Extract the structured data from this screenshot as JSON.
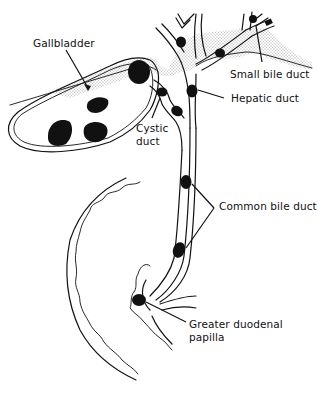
{
  "figure": {
    "type": "anatomical line drawing",
    "colors": {
      "ink": "#111111",
      "background": "#ffffff"
    }
  },
  "labels": {
    "gallbladder": "Gallbladder",
    "small_bile_duct": "Small bile duct",
    "hepatic_duct": "Hepatic duct",
    "cystic_duct_line1": "Cystic",
    "cystic_duct_line2": "duct",
    "common_bile_duct": "Common bile duct",
    "papilla_line1": "Greater duodenal",
    "papilla_line2": "papilla"
  },
  "structures": [
    {
      "name": "gallbladder",
      "stones": 4
    },
    {
      "name": "cystic duct",
      "stones": 2
    },
    {
      "name": "hepatic duct",
      "stones": 1
    },
    {
      "name": "small bile ducts",
      "stones": 3
    },
    {
      "name": "common bile duct",
      "stones": 2
    },
    {
      "name": "greater duodenal papilla",
      "stones": 1
    },
    {
      "name": "duodenum",
      "stones": 0
    },
    {
      "name": "liver (stippled)",
      "stones": 0
    }
  ]
}
